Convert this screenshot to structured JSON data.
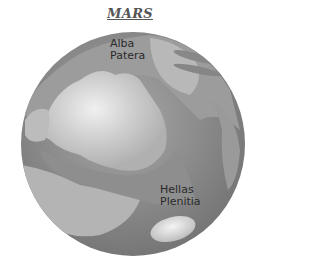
{
  "title": "MARS",
  "labels": {
    "alba": {
      "line1": "Alba",
      "line2": "Patera"
    },
    "hellas": {
      "line1": "Hellas",
      "line2": "Plenitia"
    }
  },
  "colors": {
    "dark_region": "#7a7a7a",
    "mid_region": "#9a9a9a",
    "light_region": "#d2d2d2",
    "text": "#2a2a2a"
  }
}
